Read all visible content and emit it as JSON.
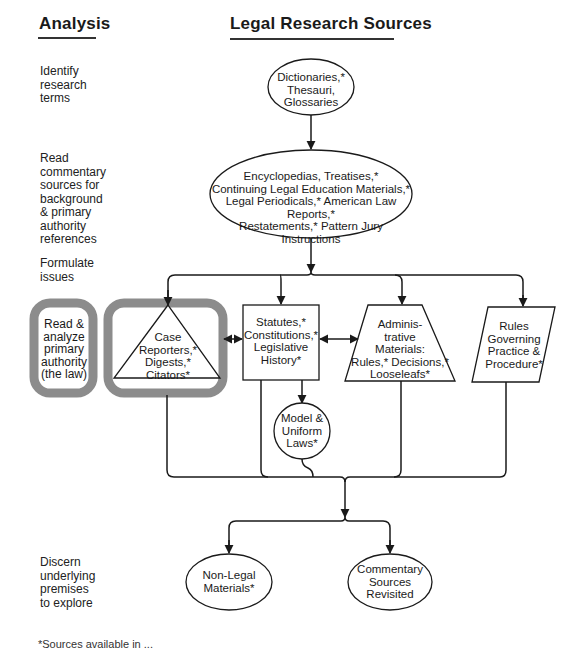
{
  "headings": {
    "analysis": "Analysis",
    "sources": "Legal Research Sources"
  },
  "analysis_steps": [
    {
      "id": "identify",
      "lines": [
        "Identify",
        "research",
        "terms"
      ]
    },
    {
      "id": "read-commentary",
      "lines": [
        "Read",
        "commentary",
        "sources for",
        "background",
        "& primary",
        "authority",
        "references"
      ]
    },
    {
      "id": "formulate",
      "lines": [
        "Formulate",
        "issues"
      ]
    },
    {
      "id": "read-analyze",
      "lines": [
        "Read &",
        "analyze",
        "primary",
        "authority",
        "(the law)"
      ]
    },
    {
      "id": "discern",
      "lines": [
        "Discern",
        "underlying",
        "premises",
        "to explore"
      ]
    }
  ],
  "nodes": {
    "dictionaries": {
      "shape": "ellipse",
      "lines": [
        "Dictionaries,*",
        "Thesauri,",
        "Glossaries"
      ]
    },
    "encyclopedias": {
      "shape": "ellipse",
      "lines": [
        "Encyclopedias, Treatises,*",
        "Continuing Legal Education Materials,*",
        "Legal Periodicals,* American Law Reports,*",
        "Restatements,* Pattern Jury Instructions"
      ]
    },
    "case": {
      "shape": "triangle",
      "highlighted": true,
      "lines": [
        "Case",
        "Reporters,*",
        "Digests,*",
        "Citators*"
      ]
    },
    "statutes": {
      "shape": "rectangle",
      "lines": [
        "Statutes,*",
        "Constitutions,*",
        "Legislative",
        "History*"
      ]
    },
    "administrative": {
      "shape": "trapezoid",
      "lines": [
        "Adminis-",
        "trative",
        "Materials:",
        "Rules,* Decisions,*",
        "Looseleafs*"
      ]
    },
    "rules": {
      "shape": "parallelogram",
      "lines": [
        "Rules",
        "Governing",
        "Practice &",
        "Procedure*"
      ]
    },
    "model": {
      "shape": "circle",
      "lines": [
        "Model &",
        "Uniform",
        "Laws*"
      ]
    },
    "nonlegal": {
      "shape": "ellipse",
      "lines": [
        "Non-Legal",
        "Materials*"
      ]
    },
    "commentary": {
      "shape": "ellipse",
      "lines": [
        "Commentary",
        "Sources",
        "Revisited"
      ]
    }
  },
  "footnote": "*Sources available in ...",
  "colors": {
    "highlight": "#8c8c8c",
    "line": "#1a1a1a",
    "background": "#ffffff"
  }
}
